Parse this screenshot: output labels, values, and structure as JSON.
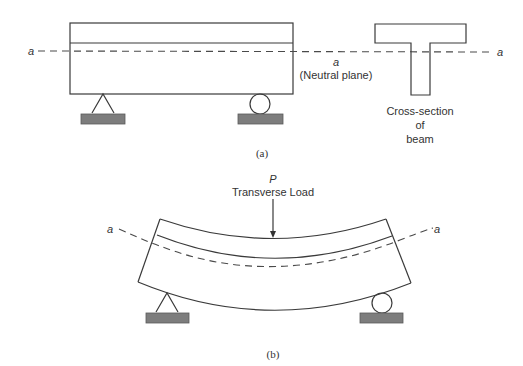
{
  "figure_a": {
    "caption": "(a)",
    "axis_label_left": "a",
    "axis_label_right": "a",
    "neutral_label_symbol": "a",
    "neutral_label_text": "(Neutral plane)",
    "cross_section_label_line1": "Cross-section",
    "cross_section_label_line2": "of",
    "cross_section_label_line3": "beam",
    "supports": [
      "pin-support",
      "roller-support"
    ]
  },
  "figure_b": {
    "caption": "(b)",
    "load_symbol": "P",
    "load_label": "Transverse Load",
    "axis_label_left": "a",
    "axis_label_right": "a",
    "supports": [
      "pin-support",
      "roller-support"
    ]
  },
  "colors": {
    "stroke": "#3a3a3a",
    "ground": "#7d7d7d",
    "background": "#ffffff"
  }
}
